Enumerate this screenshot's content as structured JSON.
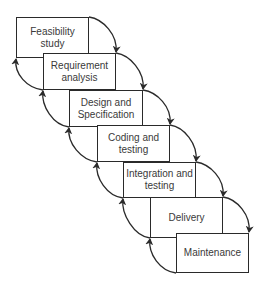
{
  "diagram": {
    "type": "waterfall-model-with-feedback",
    "phases": [
      {
        "label": "Feasibility\nstudy",
        "box": [
          16,
          17,
          73,
          41
        ]
      },
      {
        "label": "Requirement\nanalysis",
        "box": [
          43,
          53,
          73,
          37
        ]
      },
      {
        "label": "Design and\nSpecification",
        "box": [
          69,
          90,
          74,
          37
        ]
      },
      {
        "label": "Coding and\ntesting",
        "box": [
          97,
          125,
          73,
          37
        ]
      },
      {
        "label": "Integration and\ntesting",
        "box": [
          123,
          162,
          73,
          36
        ]
      },
      {
        "label": "Delivery",
        "box": [
          150,
          197,
          73,
          41
        ]
      },
      {
        "label": "Maintenance",
        "box": [
          176,
          233,
          73,
          40
        ]
      }
    ],
    "forward_arrows": [
      {
        "from": "Feasibility study",
        "to": "Requirement analysis"
      },
      {
        "from": "Requirement analysis",
        "to": "Design and Specification"
      },
      {
        "from": "Design and Specification",
        "to": "Coding and testing"
      },
      {
        "from": "Coding and testing",
        "to": "Integration and testing"
      },
      {
        "from": "Integration and testing",
        "to": "Delivery"
      },
      {
        "from": "Delivery",
        "to": "Maintenance"
      }
    ],
    "feedback_arrows": [
      {
        "from": "Requirement analysis",
        "to": "Feasibility study"
      },
      {
        "from": "Design and Specification",
        "to": "Requirement analysis"
      },
      {
        "from": "Coding and testing",
        "to": "Design and Specification"
      },
      {
        "from": "Integration and testing",
        "to": "Coding and testing"
      },
      {
        "from": "Delivery",
        "to": "Integration and testing"
      },
      {
        "from": "Maintenance",
        "to": "Delivery"
      }
    ],
    "colors": {
      "stroke": "#2a2a2a",
      "text": "#3a3a3a",
      "background": "#ffffff"
    }
  }
}
